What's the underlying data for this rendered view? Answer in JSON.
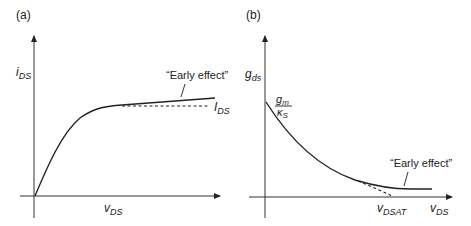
{
  "panels": [
    {
      "id": "a",
      "panel_label": "(a)",
      "y_label": {
        "main": "i",
        "sub": "DS"
      },
      "x_label": {
        "main": "v",
        "sub": "DS"
      },
      "annotation": "“Early effect”",
      "dashed_label": {
        "main": "I",
        "sub": "DS"
      },
      "description": "Drain current rises with v_DS and saturates; solid line keeps rising slightly (Early effect), dashed line shows ideal constant I_DS"
    },
    {
      "id": "b",
      "panel_label": "(b)",
      "y_label": {
        "main": "g",
        "sub": "ds"
      },
      "intercept_label": {
        "num_main": "g",
        "num_sub": "m",
        "den_main": "κ",
        "den_sub": "S"
      },
      "x_label": {
        "main": "v",
        "sub": "DS"
      },
      "x_marker": {
        "main": "v",
        "sub": "DSAT"
      },
      "annotation": "“Early effect”",
      "description": "Output conductance decays from g_m/kappa_S toward zero at v_DSAT (dashed ideal); solid line levels off at a small nonzero value due to Early effect"
    }
  ]
}
